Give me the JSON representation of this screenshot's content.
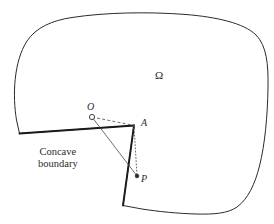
{
  "figure": {
    "background_color": "#ffffff",
    "ink_color": "#2b2b2b",
    "width": 274,
    "height": 224
  },
  "labels": {
    "omega": "Ω",
    "point_o": "O",
    "point_a": "A",
    "point_p": "P",
    "caption_line1": "Concave",
    "caption_line2": "boundary"
  },
  "geometry": {
    "domain_outline_path": "M 19.5 133.5 L 16.5 120.0 C 12.5 96.0 13.5 62.0 27.0 41.0 C 36.0 27.5 52.0 20.5 72.0 17.5 C 104.0 12.5 148.0 11.5 186.0 14.5 C 216.0 17.0 244.0 23.0 256.0 35.0 C 266.5 45.5 268.5 64.0 268.0 88.0 C 267.5 116.0 265.0 144.0 259.5 166.0 C 255.0 184.0 248.0 199.0 237.0 207.0 C 228.0 213.5 213.0 214.5 196.0 214.0 C 178.0 213.5 158.0 211.5 142.0 209.0 L 123.0 205.5 L 134.0 125.5 L 19.5 133.5 Z",
    "concave_notch_edges": [
      {
        "name": "edge-left-to-a",
        "x1": 19.5,
        "y1": 133.5,
        "x2": 134.0,
        "y2": 125.5
      },
      {
        "name": "edge-a-to-bottom",
        "x1": 134.0,
        "y1": 125.5,
        "x2": 123.0,
        "y2": 205.5
      }
    ],
    "points": [
      {
        "name": "O",
        "x": 92.0,
        "y": 117.0,
        "marker": "open-circle",
        "radius": 2.6
      },
      {
        "name": "A",
        "x": 134.0,
        "y": 125.5,
        "marker": "corner-vertex",
        "radius": 0
      },
      {
        "name": "P",
        "x": 137.0,
        "y": 176.0,
        "marker": "filled-dot",
        "radius": 1.9
      }
    ],
    "connectors": [
      {
        "name": "segment-o-to-a",
        "style": "dashed",
        "x1": 92.0,
        "y1": 117.0,
        "x2": 134.0,
        "y2": 125.5
      },
      {
        "name": "segment-a-to-p",
        "style": "dotted",
        "x1": 134.0,
        "y1": 125.5,
        "x2": 137.0,
        "y2": 176.0
      },
      {
        "name": "segment-o-to-p",
        "style": "solid-thin",
        "x1": 92.0,
        "y1": 117.0,
        "x2": 137.0,
        "y2": 176.0
      }
    ]
  },
  "label_positions": {
    "omega": {
      "left": 155,
      "top": 69
    },
    "point_o": {
      "left": 87,
      "top": 101
    },
    "point_a": {
      "left": 141,
      "top": 117
    },
    "point_p": {
      "left": 141,
      "top": 173
    },
    "caption": {
      "left": 38,
      "top": 146
    }
  },
  "styles": {
    "outline_stroke_width": 1.0,
    "notch_stroke_width": 1.9,
    "connector_stroke_width": 0.8,
    "dash_pattern": "3,2.2",
    "dot_pattern": "1,2.2"
  }
}
